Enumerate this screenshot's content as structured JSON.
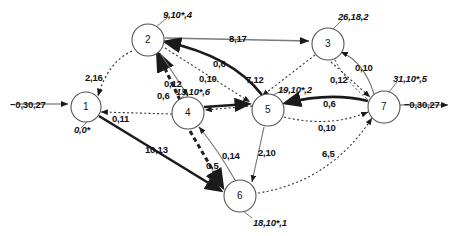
{
  "figure": {
    "kind": "network-flow-graph",
    "background": "#ffffff",
    "stroke_dark": "#222222",
    "stroke_mid": "#666666",
    "text_color": "#111111"
  },
  "nodes": [
    {
      "id": "1",
      "label": "1",
      "cx": 86,
      "cy": 107,
      "r": 15,
      "annotation": "0,0*",
      "ann_x": 74,
      "ann_y": 124,
      "ann_italic": true
    },
    {
      "id": "2",
      "label": "2",
      "cx": 148,
      "cy": 40,
      "r": 16,
      "annotation": "9,10*,4",
      "ann_x": 163,
      "ann_y": 9,
      "ann_italic": true
    },
    {
      "id": "3",
      "label": "3",
      "cx": 328,
      "cy": 44,
      "r": 16,
      "annotation": "26,18,2",
      "ann_x": 338,
      "ann_y": 11,
      "ann_italic": true
    },
    {
      "id": "4",
      "label": "4",
      "cx": 188,
      "cy": 113,
      "r": 16,
      "annotation": "13,10*,6",
      "ann_x": 176,
      "ann_y": 86,
      "ann_italic": true
    },
    {
      "id": "5",
      "label": "5",
      "cx": 268,
      "cy": 110,
      "r": 16,
      "annotation": "19,10*,2",
      "ann_x": 278,
      "ann_y": 84,
      "ann_italic": true
    },
    {
      "id": "6",
      "label": "6",
      "cx": 240,
      "cy": 196,
      "r": 16,
      "annotation": "18,10*,1",
      "ann_x": 253,
      "ann_y": 217,
      "ann_italic": true
    },
    {
      "id": "7",
      "label": "7",
      "cx": 384,
      "cy": 107,
      "r": 16,
      "annotation": "31,10*,5",
      "ann_x": 393,
      "ann_y": 73,
      "ann_italic": true
    }
  ],
  "external": {
    "source_label": "−0,30,27",
    "source_label_x": 10,
    "source_label_y": 99,
    "sink_label": "−0,30,27",
    "sink_label_x": 404,
    "sink_label_y": 99
  },
  "edge_labels": [
    {
      "text": "2,16",
      "x": 85,
      "y": 72,
      "name": "edge-label-1-2"
    },
    {
      "text": "0,12",
      "x": 164,
      "y": 78,
      "name": "edge-label-2-4-a"
    },
    {
      "text": "0,6",
      "x": 157,
      "y": 90,
      "name": "edge-label-4-2-b"
    },
    {
      "text": "0,6",
      "x": 213,
      "y": 58,
      "name": "edge-label-2-5-a"
    },
    {
      "text": "0,10",
      "x": 199,
      "y": 73,
      "name": "edge-label-2-5-b"
    },
    {
      "text": "8,17",
      "x": 229,
      "y": 33,
      "name": "edge-label-2-3"
    },
    {
      "text": "7,12",
      "x": 246,
      "y": 74,
      "name": "edge-label-5-3"
    },
    {
      "text": "0,11",
      "x": 112,
      "y": 113,
      "name": "edge-label-4-1"
    },
    {
      "text": "10,13",
      "x": 145,
      "y": 144,
      "name": "edge-label-1-6"
    },
    {
      "text": "0,5",
      "x": 206,
      "y": 160,
      "name": "edge-label-4-6"
    },
    {
      "text": "0,14",
      "x": 222,
      "y": 150,
      "name": "edge-label-6-4"
    },
    {
      "text": "2,10",
      "x": 258,
      "y": 147,
      "name": "edge-label-5-6"
    },
    {
      "text": "0,6",
      "x": 323,
      "y": 98,
      "name": "edge-label-7-5"
    },
    {
      "text": "0,10",
      "x": 318,
      "y": 122,
      "name": "edge-label-5-7"
    },
    {
      "text": "0,10",
      "x": 355,
      "y": 62,
      "name": "edge-label-7-3-a"
    },
    {
      "text": "0,12",
      "x": 330,
      "y": 74,
      "name": "edge-label-3-7-b"
    },
    {
      "text": "6,5",
      "x": 322,
      "y": 148,
      "name": "edge-label-6-7"
    }
  ]
}
